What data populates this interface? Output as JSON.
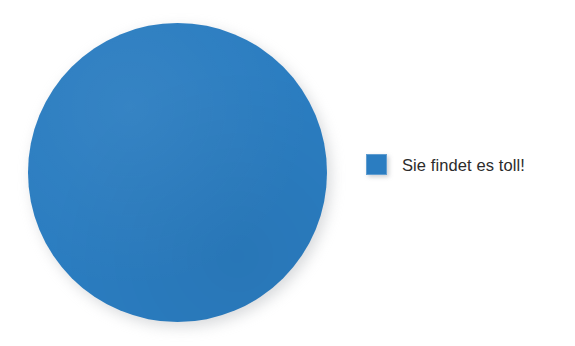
{
  "chart_data": {
    "type": "pie",
    "title": "",
    "subtitle": "",
    "xlabel": "",
    "ylabel": "",
    "grid": false,
    "legend_position": "right",
    "categories": [
      "Sie findet es toll!"
    ],
    "values": [
      100
    ],
    "units": "percent",
    "value_labels_shown": false,
    "slices": [
      {
        "label": "Sie findet es toll!",
        "value": 100,
        "percent": "100%",
        "color": "#2b7dc1",
        "start_angle": 0,
        "end_angle": 360
      }
    ]
  },
  "figure": {
    "background_color": "#ffffff",
    "shadow_color": "#b9bcc0"
  },
  "pie": {
    "slice_label": "Sie findet es toll!",
    "slice_color": "#2b7dc1",
    "center_x": 177,
    "center_y": 172,
    "diameter": 299
  },
  "legend": {
    "items": [
      {
        "label": "Sie findet es toll!",
        "color": "#2b7dc1",
        "swatch_name": "legend-swatch-blue"
      }
    ]
  }
}
